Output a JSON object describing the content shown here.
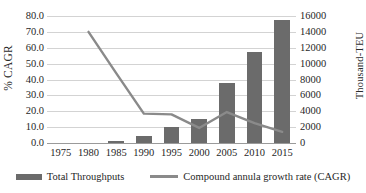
{
  "chart_data": {
    "type": "bar",
    "title": "",
    "xlabel": "",
    "ylabel": "% CAGR",
    "y2label": "Thousand-TEU",
    "categories": [
      "1975",
      "1980",
      "1985",
      "1990",
      "1995",
      "2000",
      "2005",
      "2010",
      "2015"
    ],
    "ylim": [
      0,
      80
    ],
    "y2lim": [
      0,
      16000
    ],
    "yticks": [
      "0.0",
      "10.0",
      "20.0",
      "30.0",
      "40.0",
      "50.0",
      "60.0",
      "70.0",
      "80.0"
    ],
    "y2ticks": [
      "0",
      "2000",
      "4000",
      "6000",
      "8000",
      "10000",
      "12000",
      "14000",
      "16000"
    ],
    "grid": true,
    "legend_position": "bottom",
    "series": [
      {
        "name": "Total Throughputs",
        "type": "bar",
        "axis": "right",
        "unit": "Thousand-TEU",
        "color": "#6b6b6b",
        "values": [
          0,
          0,
          300,
          850,
          2000,
          3000,
          7550,
          11500,
          15500
        ],
        "values_percent_scale": [
          0.0,
          0.0,
          1.5,
          4.3,
          10.0,
          15.0,
          37.8,
          57.5,
          77.5
        ]
      },
      {
        "name": "Compound annula growth rate (CAGR)",
        "type": "line",
        "axis": "left",
        "unit": "% CAGR",
        "color": "#8a8a8a",
        "x": [
          "1980",
          "1985",
          "1990",
          "1995",
          "2000",
          "2005",
          "2010",
          "2015"
        ],
        "values": [
          70.0,
          44.0,
          18.5,
          18.0,
          9.5,
          19.5,
          12.5,
          7.0
        ]
      }
    ]
  },
  "legend": {
    "items": [
      {
        "label": "Total Throughputs",
        "marker": "bar-swatch"
      },
      {
        "label": "Compound annula growth rate (CAGR)",
        "marker": "line-swatch"
      }
    ]
  },
  "colors": {
    "bar": "#6b6b6b",
    "line": "#8a8a8a",
    "grid": "#d3d3d3",
    "axis": "#9a9a9a",
    "text": "#1f1f1f",
    "background": "#ffffff"
  }
}
